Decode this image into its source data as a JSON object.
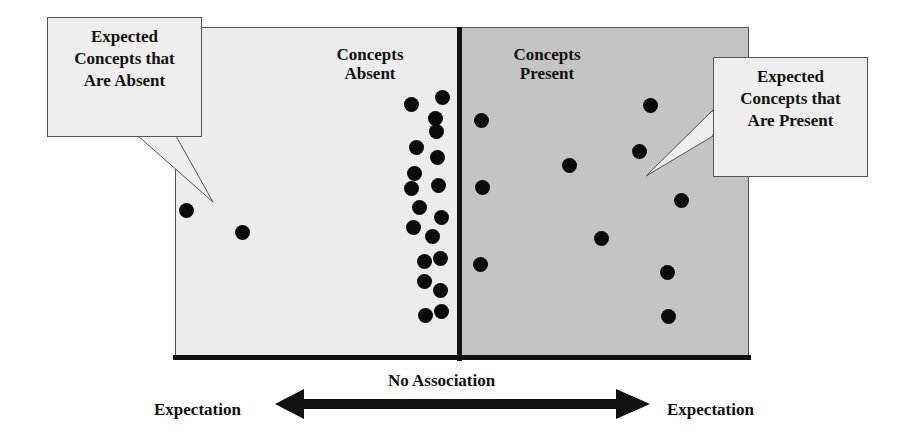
{
  "diagram": {
    "panels": {
      "left": {
        "title_line1": "Concepts",
        "title_line2": "Absent",
        "fill": "#ececec"
      },
      "right": {
        "title_line1": "Concepts",
        "title_line2": "Present",
        "fill": "#c4c4c4"
      }
    },
    "callouts": {
      "left": {
        "line1": "Expected",
        "line2": "Concepts that",
        "line3": "Are Absent"
      },
      "right": {
        "line1": "Expected",
        "line2": "Concepts that",
        "line3": "Are Present"
      }
    },
    "axis": {
      "center_label": "No Association",
      "left_label": "Expectation",
      "right_label": "Expectation"
    },
    "dots": [
      [
        186,
        210
      ],
      [
        242,
        232
      ],
      [
        411,
        104
      ],
      [
        442,
        97
      ],
      [
        435,
        118
      ],
      [
        436,
        131
      ],
      [
        416,
        147
      ],
      [
        437,
        157
      ],
      [
        414,
        173
      ],
      [
        411,
        188
      ],
      [
        438,
        185
      ],
      [
        419,
        207
      ],
      [
        441,
        217
      ],
      [
        413,
        227
      ],
      [
        432,
        236
      ],
      [
        440,
        258
      ],
      [
        424,
        261
      ],
      [
        424,
        281
      ],
      [
        440,
        290
      ],
      [
        425,
        315
      ],
      [
        441,
        311
      ],
      [
        481,
        120
      ],
      [
        482,
        187
      ],
      [
        480,
        264
      ],
      [
        569,
        165
      ],
      [
        601,
        238
      ],
      [
        650,
        105
      ],
      [
        639,
        151
      ],
      [
        681,
        200
      ],
      [
        667,
        272
      ],
      [
        668,
        316
      ]
    ]
  }
}
